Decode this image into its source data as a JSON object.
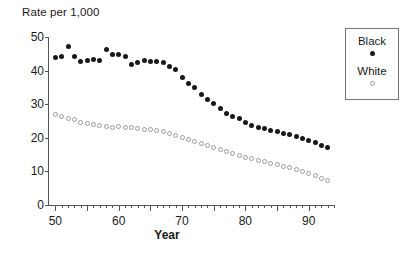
{
  "chart_data": {
    "type": "scatter",
    "title": "Rate per 1,000",
    "xlabel": "Year",
    "ylabel": "Rate per 1,000",
    "xlim": [
      49,
      94
    ],
    "ylim": [
      0,
      50
    ],
    "xticks_labeled": [
      50,
      60,
      70,
      80,
      90
    ],
    "yticks_labeled": [
      0,
      10,
      20,
      30,
      40,
      50
    ],
    "xtick_minor_step": 1,
    "xtick_major_step": 5,
    "grid": false,
    "legend_position": "outside-right-top",
    "x": [
      50,
      51,
      52,
      53,
      54,
      55,
      56,
      57,
      58,
      59,
      60,
      61,
      62,
      63,
      64,
      65,
      66,
      67,
      68,
      69,
      70,
      71,
      72,
      73,
      74,
      75,
      76,
      77,
      78,
      79,
      80,
      81,
      82,
      83,
      84,
      85,
      86,
      87,
      88,
      89,
      90,
      91,
      92,
      93
    ],
    "series": [
      {
        "name": "Black",
        "marker": "filled-circle",
        "color": "#18181a",
        "values": [
          44.0,
          44.3,
          47.3,
          44.2,
          42.7,
          43.1,
          43.4,
          43.0,
          46.3,
          44.7,
          44.8,
          44.3,
          41.8,
          42.5,
          43.0,
          42.8,
          42.7,
          42.3,
          41.3,
          40.3,
          37.8,
          36.2,
          35.0,
          32.8,
          31.3,
          30.2,
          28.8,
          27.2,
          26.3,
          25.8,
          24.7,
          23.8,
          23.2,
          22.8,
          22.3,
          21.8,
          21.3,
          20.9,
          20.3,
          19.8,
          19.2,
          18.5,
          17.7,
          17.0
        ]
      },
      {
        "name": "White",
        "marker": "open-circle",
        "color": "#9a9a9a",
        "values": [
          27.0,
          26.2,
          25.7,
          25.3,
          24.6,
          24.3,
          24.0,
          23.6,
          23.4,
          23.2,
          23.5,
          23.2,
          23.0,
          22.8,
          22.6,
          22.4,
          22.1,
          21.8,
          21.3,
          20.8,
          20.2,
          19.6,
          19.0,
          18.4,
          17.6,
          17.1,
          16.5,
          15.9,
          15.3,
          14.8,
          14.2,
          13.8,
          13.3,
          12.9,
          12.4,
          12.0,
          11.5,
          11.1,
          10.6,
          10.0,
          9.4,
          8.7,
          8.0,
          7.3
        ]
      }
    ]
  }
}
